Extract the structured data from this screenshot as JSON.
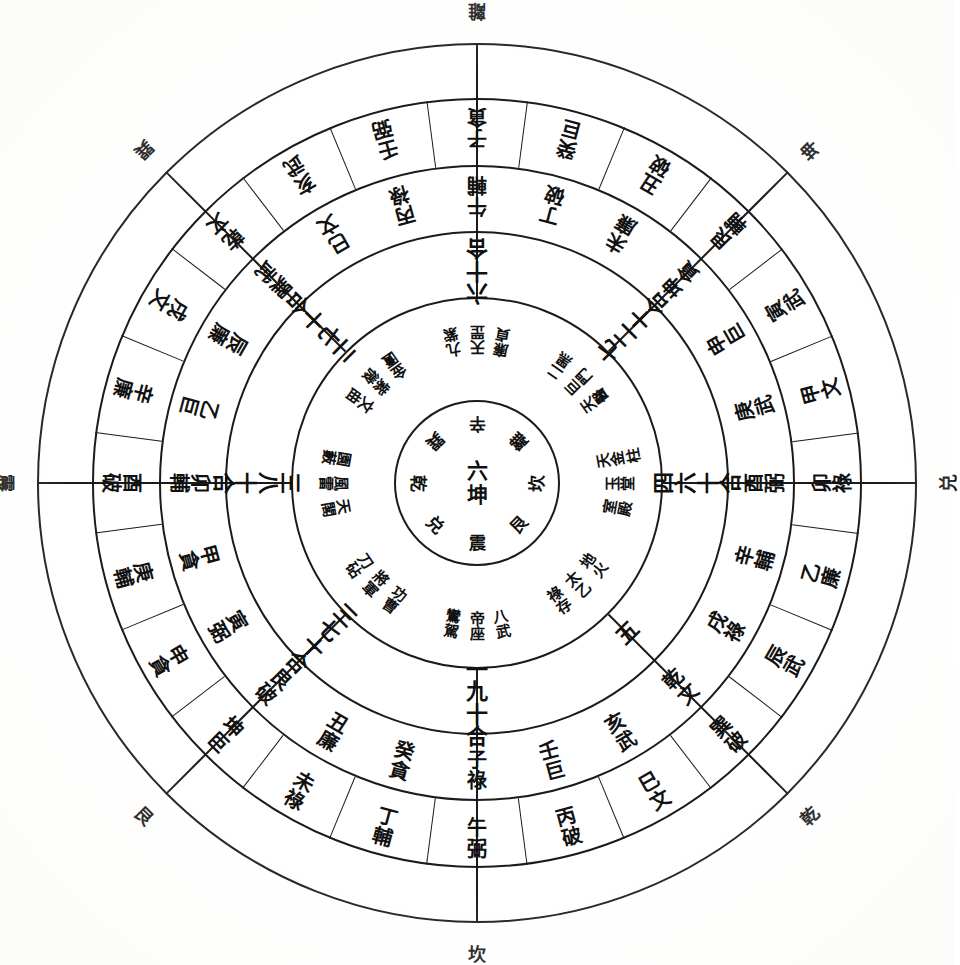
{
  "diagram": {
    "type": "luopan-geomantic-compass",
    "shape": "concentric-circles",
    "ring_count": 5,
    "sector_count": 8,
    "orientation_note": "text rotated to face outward from centre; south (離) at top, north (坎) at bottom",
    "ink_color": "#1b1b1b",
    "paper_color": "#ffffff"
  },
  "outer_labels": [
    {
      "name": "li",
      "char": "離",
      "angle": 0
    },
    {
      "name": "kun",
      "char": "坤",
      "angle": 45
    },
    {
      "name": "dui",
      "char": "兑",
      "angle": 90
    },
    {
      "name": "qian",
      "char": "乾",
      "angle": 135
    },
    {
      "name": "kan",
      "char": "坎",
      "angle": 180
    },
    {
      "name": "gen",
      "char": "艮",
      "angle": 225
    },
    {
      "name": "zhen",
      "char": "震",
      "angle": 270
    },
    {
      "name": "xun",
      "char": "巽",
      "angle": 315
    }
  ],
  "ring1": {
    "label": "outer twenty-four mountains ring",
    "cells": [
      {
        "angle": -15,
        "chars": [
          "壬",
          "弼"
        ]
      },
      {
        "angle": 0,
        "chars": [
          "子",
          "貪"
        ]
      },
      {
        "angle": 15,
        "chars": [
          "癸",
          "巨"
        ]
      },
      {
        "angle": 30,
        "chars": [
          "丑",
          "破"
        ]
      },
      {
        "angle": 45,
        "chars": [
          "艮",
          "輔"
        ]
      },
      {
        "angle": 60,
        "chars": [
          "寅",
          "武"
        ]
      },
      {
        "angle": 75,
        "chars": [
          "甲",
          "文"
        ]
      },
      {
        "angle": 90,
        "chars": [
          "卯",
          "祿"
        ]
      },
      {
        "angle": 105,
        "chars": [
          "乙",
          "廉"
        ]
      },
      {
        "angle": 120,
        "chars": [
          "辰",
          "武"
        ]
      },
      {
        "angle": 135,
        "chars": [
          "巽",
          "破"
        ]
      },
      {
        "angle": 150,
        "chars": [
          "巳",
          "文"
        ]
      },
      {
        "angle": 165,
        "chars": [
          "丙",
          "破"
        ]
      },
      {
        "angle": 180,
        "chars": [
          "午",
          "弼"
        ]
      },
      {
        "angle": 195,
        "chars": [
          "丁",
          "輔"
        ]
      },
      {
        "angle": 210,
        "chars": [
          "未",
          "祿"
        ]
      },
      {
        "angle": 225,
        "chars": [
          "坤",
          "巨"
        ]
      },
      {
        "angle": 240,
        "chars": [
          "申",
          "貪"
        ]
      },
      {
        "angle": 255,
        "chars": [
          "庚",
          "輔"
        ]
      },
      {
        "angle": 270,
        "chars": [
          "酉",
          "破"
        ]
      },
      {
        "angle": 285,
        "chars": [
          "辛",
          "廉"
        ]
      },
      {
        "angle": 300,
        "chars": [
          "戌",
          "文"
        ]
      },
      {
        "angle": 315,
        "chars": [
          "乾",
          "文"
        ]
      },
      {
        "angle": 330,
        "chars": [
          "亥",
          "武"
        ]
      }
    ]
  },
  "ring2": {
    "label": "inner twenty-four mountains ring",
    "cells": [
      {
        "angle": -15,
        "chars": [
          "丙",
          "祿"
        ]
      },
      {
        "angle": 0,
        "chars": [
          "午",
          "輔"
        ]
      },
      {
        "angle": 15,
        "chars": [
          "丁",
          "破"
        ]
      },
      {
        "angle": 30,
        "chars": [
          "未",
          "廉"
        ]
      },
      {
        "angle": 45,
        "chars": [
          "坤",
          "貪"
        ]
      },
      {
        "angle": 60,
        "chars": [
          "申",
          "巨"
        ]
      },
      {
        "angle": 75,
        "chars": [
          "庚",
          "武"
        ]
      },
      {
        "angle": 90,
        "chars": [
          "酉",
          "弼"
        ]
      },
      {
        "angle": 105,
        "chars": [
          "辛",
          "輔"
        ]
      },
      {
        "angle": 120,
        "chars": [
          "戌",
          "祿"
        ]
      },
      {
        "angle": 135,
        "chars": [
          "乾",
          "文"
        ]
      },
      {
        "angle": 150,
        "chars": [
          "亥",
          "武"
        ]
      },
      {
        "angle": 165,
        "chars": [
          "壬",
          "巨"
        ]
      },
      {
        "angle": 180,
        "chars": [
          "子",
          "祿"
        ]
      },
      {
        "angle": 195,
        "chars": [
          "癸",
          "貪"
        ]
      },
      {
        "angle": 210,
        "chars": [
          "丑",
          "廉"
        ]
      },
      {
        "angle": 225,
        "chars": [
          "艮",
          "破"
        ]
      },
      {
        "angle": 240,
        "chars": [
          "寅",
          "弼"
        ]
      },
      {
        "angle": 255,
        "chars": [
          "甲",
          "貪"
        ]
      },
      {
        "angle": 270,
        "chars": [
          "卯",
          "輔"
        ]
      },
      {
        "angle": 285,
        "chars": [
          "乙",
          "巨"
        ]
      },
      {
        "angle": 300,
        "chars": [
          "辰",
          "廉"
        ]
      },
      {
        "angle": 315,
        "chars": [
          "巽",
          "武"
        ]
      },
      {
        "angle": 330,
        "chars": [
          "巳",
          "文"
        ]
      }
    ]
  },
  "ring3": {
    "label": "he-shu number combination ring",
    "cells": [
      {
        "angle": 0,
        "name": "six-ten-he",
        "chars": [
          "六",
          "十",
          "合"
        ]
      },
      {
        "angle": 45,
        "name": "seven-two-ten-he",
        "chars": [
          "七",
          "二",
          "十",
          "合"
        ]
      },
      {
        "angle": 90,
        "name": "four-six-ten-he",
        "chars": [
          "四",
          "六",
          "十",
          "合"
        ]
      },
      {
        "angle": 135,
        "name": "five",
        "chars": [
          "五"
        ]
      },
      {
        "angle": 180,
        "name": "one-nine-ten-he",
        "chars": [
          "一",
          "九",
          "十",
          "合"
        ]
      },
      {
        "angle": 225,
        "name": "three-seven-ten-he",
        "chars": [
          "三",
          "七",
          "十",
          "合"
        ]
      },
      {
        "angle": 270,
        "name": "three-eight-ten-he",
        "chars": [
          "三",
          "八",
          "十",
          "合"
        ]
      },
      {
        "angle": 315,
        "name": "two-seven-ten-he",
        "chars": [
          "二",
          "七",
          "十",
          "合"
        ]
      }
    ]
  },
  "ring4": {
    "label": "star / palace names ring",
    "cells": [
      {
        "angle": 0,
        "cols": [
          [
            "九",
            "紫"
          ],
          [
            "天",
            "罡"
          ],
          [
            "廉",
            "貞"
          ]
        ]
      },
      {
        "angle": 45,
        "cols": [
          [
            "二",
            "黑"
          ],
          [
            "巨",
            "門"
          ],
          [
            "天",
            "醫"
          ]
        ]
      },
      {
        "angle": 90,
        "cols": [
          [
            "天",
            "金",
            "柱"
          ],
          [
            "玉",
            "堂"
          ],
          [
            "室",
            "殿"
          ]
        ]
      },
      {
        "angle": 135,
        "cols": [
          [
            "地",
            "火"
          ],
          [
            "太",
            "乙"
          ],
          [
            "祿",
            "存"
          ]
        ]
      },
      {
        "angle": 180,
        "cols": [
          [
            "八",
            "武"
          ],
          [
            "帝",
            "座"
          ],
          [
            "鸞",
            "駕"
          ]
        ]
      },
      {
        "angle": 225,
        "cols": [
          [
            "功",
            "曹"
          ],
          [
            "將",
            "軍"
          ],
          [
            "刀",
            "砧"
          ]
        ]
      },
      {
        "angle": 270,
        "cols": [
          [
            "天",
            "閣"
          ],
          [
            "風",
            "雷"
          ],
          [
            "園",
            "藪"
          ]
        ]
      },
      {
        "angle": 315,
        "cols": [
          [
            "文",
            "曲"
          ],
          [
            "紫",
            "微"
          ],
          [
            "金",
            "匱"
          ]
        ]
      }
    ]
  },
  "core": {
    "center_chars": [
      "六",
      "坤"
    ],
    "spokes": [
      {
        "angle": 0,
        "char": "辛"
      },
      {
        "angle": 45,
        "char": "離"
      },
      {
        "angle": 90,
        "char": "坎"
      },
      {
        "angle": 135,
        "char": "艮"
      },
      {
        "angle": 180,
        "char": "震"
      },
      {
        "angle": 225,
        "char": "兑"
      },
      {
        "angle": 270,
        "char": "乾"
      },
      {
        "angle": 315,
        "char": "巽"
      }
    ]
  }
}
